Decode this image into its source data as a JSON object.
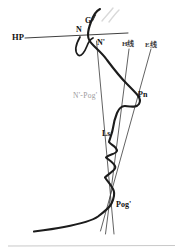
{
  "figure": {
    "type": "cephalometric-profile-tracing",
    "background_color": "#ffffff",
    "ink_color": "#1c1c1c",
    "muted_label_color": "#9b9b9b",
    "labels": {
      "hp_line": "HP",
      "nasion": "N",
      "glabella": "G",
      "soft_tissue_nasion": "N'",
      "h_line": "H线",
      "e_line": "E线",
      "n_pog_line": "N'-Pog'",
      "pronasale": "Pn",
      "labrale_superius": "Ls",
      "soft_tissue_pogonion": "Pog'"
    }
  }
}
